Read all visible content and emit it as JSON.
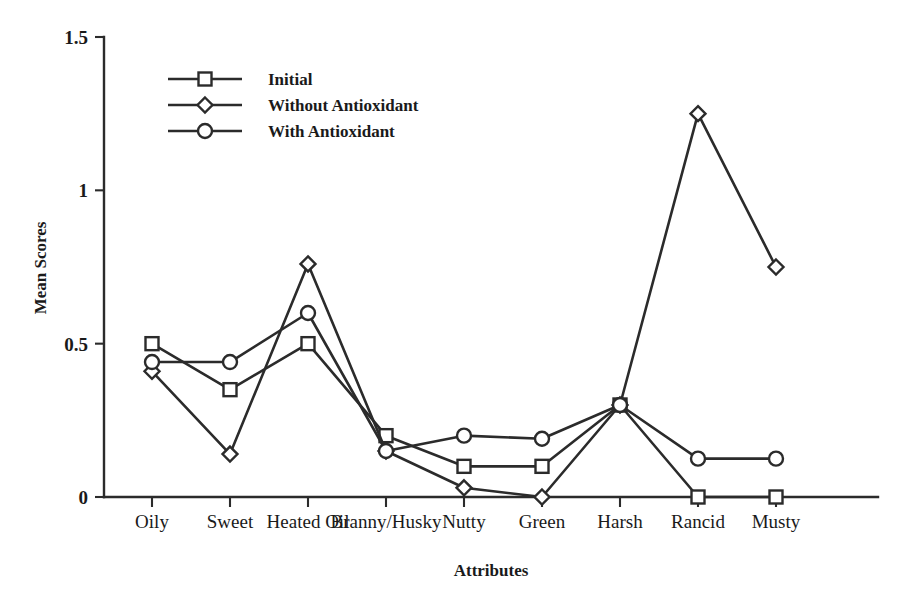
{
  "chart_data": {
    "type": "line",
    "title": "",
    "xlabel": "Attributes",
    "ylabel": "Mean Scores",
    "categories": [
      "Oily",
      "Sweet",
      "Heated Oil",
      "Branny/Husky",
      "Nutty",
      "Green",
      "Harsh",
      "Rancid",
      "Musty"
    ],
    "ylim": [
      0,
      1.5
    ],
    "xlim_note": "categorical, 9 evenly spaced attributes",
    "ytick_labels": [
      "0",
      "0.5",
      "1",
      "1.5"
    ],
    "ytick_values": [
      0,
      0.5,
      1,
      1.5
    ],
    "grid": false,
    "legend_position": "upper-left-inside",
    "series": [
      {
        "name": "Initial",
        "marker": "square",
        "values": [
          0.5,
          0.35,
          0.5,
          0.2,
          0.1,
          0.1,
          0.3,
          0.0,
          0.0
        ]
      },
      {
        "name": "Without Antioxidant",
        "marker": "diamond",
        "values": [
          0.41,
          0.14,
          0.76,
          0.15,
          0.03,
          0.0,
          0.3,
          1.25,
          0.75
        ]
      },
      {
        "name": "With  Antioxidant",
        "marker": "circle",
        "values": [
          0.44,
          0.44,
          0.6,
          0.15,
          0.2,
          0.19,
          0.3,
          0.125,
          0.125
        ]
      }
    ]
  },
  "legend": {
    "entries": [
      {
        "label": "Initial",
        "marker": "square"
      },
      {
        "label": "Without Antioxidant",
        "marker": "diamond"
      },
      {
        "label": "With  Antioxidant",
        "marker": "circle"
      }
    ]
  },
  "colors": {
    "ink": "#2b2b2b",
    "background": "#ffffff",
    "marker_fill": "#ffffff"
  },
  "caption": {
    "fragment": ""
  }
}
